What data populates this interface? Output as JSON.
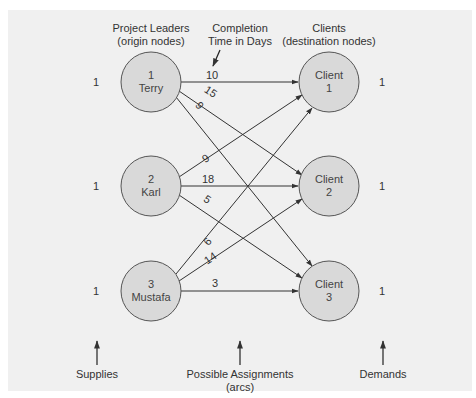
{
  "headers": {
    "origin_line1": "Project Leaders",
    "origin_line2": "(origin nodes)",
    "time_line1": "Completion",
    "time_line2": "Time in Days",
    "dest_line1": "Clients",
    "dest_line2": "(destination nodes)"
  },
  "origins": [
    {
      "id": "1",
      "name": "Terry",
      "supply": "1"
    },
    {
      "id": "2",
      "name": "Karl",
      "supply": "1"
    },
    {
      "id": "3",
      "name": "Mustafa",
      "supply": "1"
    }
  ],
  "destinations": [
    {
      "line1": "Client",
      "line2": "1",
      "demand": "1"
    },
    {
      "line1": "Client",
      "line2": "2",
      "demand": "1"
    },
    {
      "line1": "Client",
      "line2": "3",
      "demand": "1"
    }
  ],
  "arcs": [
    {
      "from": "Terry",
      "to": "Client 1",
      "days": "10"
    },
    {
      "from": "Terry",
      "to": "Client 2",
      "days": "15"
    },
    {
      "from": "Terry",
      "to": "Client 3",
      "days": "9"
    },
    {
      "from": "Karl",
      "to": "Client 1",
      "days": "9"
    },
    {
      "from": "Karl",
      "to": "Client 2",
      "days": "18"
    },
    {
      "from": "Karl",
      "to": "Client 3",
      "days": "5"
    },
    {
      "from": "Mustafa",
      "to": "Client 1",
      "days": "6"
    },
    {
      "from": "Mustafa",
      "to": "Client 2",
      "days": "14"
    },
    {
      "from": "Mustafa",
      "to": "Client 3",
      "days": "3"
    }
  ],
  "footer": {
    "supplies": "Supplies",
    "assign_line1": "Possible Assignments",
    "assign_line2": "(arcs)",
    "demands": "Demands"
  }
}
